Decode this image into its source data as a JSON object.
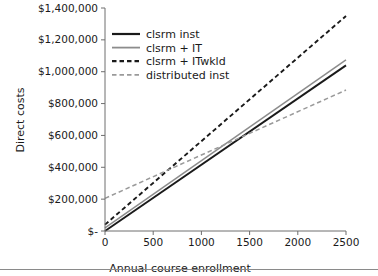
{
  "chart_data": {
    "type": "line",
    "title": "",
    "xlabel": "Annual course enrollment",
    "ylabel": "Direct costs",
    "xlim": [
      0,
      2500
    ],
    "ylim": [
      0,
      1400000
    ],
    "grid": false,
    "legend_position": "upper-left-inside",
    "x_tick_labels": [
      "0",
      "500",
      "1000",
      "1500",
      "2000",
      "2500"
    ],
    "x_tick_values": [
      0,
      500,
      1000,
      1500,
      2000,
      2500
    ],
    "y_tick_labels": [
      "$-",
      "$200,000",
      "$400,000",
      "$600,000",
      "$800,000",
      "$1,000,000",
      "$1,200,000",
      "$1,400,000"
    ],
    "y_tick_values": [
      0,
      200000,
      400000,
      600000,
      800000,
      1000000,
      1200000,
      1400000
    ],
    "x": [
      0,
      2500
    ],
    "series": [
      {
        "name": "clsrm inst",
        "values": [
          0,
          1040000
        ],
        "style": "solid",
        "color": "#1a1a1a",
        "width": 1.9
      },
      {
        "name": "clsrm + IT",
        "values": [
          20000,
          1075000
        ],
        "style": "solid",
        "color": "#8c8c8c",
        "width": 1.5
      },
      {
        "name": "clsrm + ITwkld",
        "values": [
          40000,
          1350000
        ],
        "style": "dashed",
        "color": "#1a1a1a",
        "width": 1.9
      },
      {
        "name": "distributed inst",
        "values": [
          205000,
          885000
        ],
        "style": "dashed",
        "color": "#9a9a9a",
        "width": 1.5
      }
    ]
  },
  "legend": {
    "entries": [
      {
        "label": "clsrm inst"
      },
      {
        "label": "clsrm + IT"
      },
      {
        "label": "clsrm + ITwkld"
      },
      {
        "label": "distributed inst"
      }
    ]
  },
  "axes": {
    "y_title": "Direct costs",
    "x_title": "Annual course enrollment"
  }
}
